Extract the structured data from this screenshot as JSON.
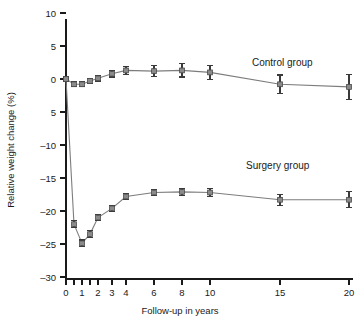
{
  "chart_data": {
    "type": "line",
    "title": "",
    "xlabel": "Follow-up in years",
    "ylabel": "Relative weight change (%)",
    "xlim": [
      0,
      20
    ],
    "ylim": [
      -30,
      10
    ],
    "grid": false,
    "legend_position": "inline-annotation",
    "x_ticks": [
      0,
      0.5,
      1,
      1.5,
      2,
      3,
      4,
      6,
      8,
      10,
      15,
      20
    ],
    "x_tick_labels": [
      "0",
      "",
      "1",
      "",
      "2",
      "3",
      "4",
      "6",
      "8",
      "10",
      "15",
      "20"
    ],
    "y_ticks": [
      10,
      5,
      0,
      -5,
      -10,
      -15,
      -20,
      -25,
      -30
    ],
    "y_tick_labels": [
      "10",
      "5",
      "0",
      "5",
      "–10",
      "–15",
      "–20",
      "–25",
      "–30"
    ],
    "x": [
      0,
      0.5,
      1,
      1.5,
      2,
      3,
      4,
      6,
      8,
      10,
      15,
      20
    ],
    "series": [
      {
        "name": "Control group",
        "label": "Control group",
        "color": "#8a8a8a",
        "values": [
          0.0,
          -0.8,
          -0.8,
          -0.3,
          0.1,
          0.8,
          1.3,
          1.2,
          1.3,
          1.0,
          -0.8,
          -1.2
        ],
        "errors": [
          0.3,
          0.4,
          0.4,
          0.4,
          0.4,
          0.5,
          0.6,
          0.8,
          1.0,
          1.1,
          1.4,
          1.9
        ]
      },
      {
        "name": "Surgery group",
        "label": "Surgery group",
        "color": "#8a8a8a",
        "values": [
          0.0,
          -22.0,
          -24.9,
          -23.5,
          -21.0,
          -19.6,
          -17.8,
          -17.2,
          -17.1,
          -17.2,
          -18.3,
          -18.3
        ],
        "errors": [
          0.3,
          0.5,
          0.5,
          0.5,
          0.5,
          0.5,
          0.5,
          0.5,
          0.5,
          0.6,
          0.8,
          1.2
        ]
      }
    ],
    "annotations": [
      {
        "text": "Control group",
        "x_px": 252,
        "y_px": 66
      },
      {
        "text": "Surgery group",
        "x_px": 246,
        "y_px": 169
      }
    ]
  },
  "axes": {
    "y_axis_label": "Relative weight change (%)",
    "x_axis_label": "Follow-up in years"
  }
}
